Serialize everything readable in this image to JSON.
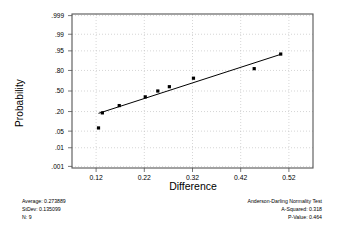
{
  "chart_data": {
    "type": "scatter",
    "title": "",
    "xlabel": "Difference",
    "ylabel": "Probability",
    "xlim": [
      0.07,
      0.57
    ],
    "xticks": [
      "0.12",
      "0.22",
      "0.32",
      "0.42",
      "0.52"
    ],
    "xtick_values": [
      0.12,
      0.22,
      0.32,
      0.42,
      0.52
    ],
    "yticks": [
      ".999",
      ".99",
      ".95",
      ".80",
      ".50",
      ".20",
      ".05",
      ".01",
      ".001"
    ],
    "ytick_values": [
      0.999,
      0.99,
      0.95,
      0.8,
      0.5,
      0.2,
      0.05,
      0.01,
      0.001
    ],
    "grid": true,
    "grid_style": "dotted",
    "points": [
      {
        "x": 0.125,
        "p": 0.065
      },
      {
        "x": 0.133,
        "p": 0.185
      },
      {
        "x": 0.168,
        "p": 0.275
      },
      {
        "x": 0.222,
        "p": 0.405
      },
      {
        "x": 0.248,
        "p": 0.5
      },
      {
        "x": 0.272,
        "p": 0.57
      },
      {
        "x": 0.322,
        "p": 0.7
      },
      {
        "x": 0.448,
        "p": 0.82
      },
      {
        "x": 0.503,
        "p": 0.935
      }
    ],
    "fit_line": {
      "x0": 0.125,
      "p0": 0.18,
      "x1": 0.505,
      "p1": 0.935
    },
    "series_name": "Difference"
  },
  "axes": {
    "y_title": "Probability",
    "x_title": "Difference"
  },
  "stats_left": {
    "average_label": "Average:",
    "average_value": "0.273889",
    "stdev_label": "StDev:",
    "stdev_value": "0.135099",
    "n_label": "N:",
    "n_value": "9",
    "line1": "Average: 0.273889",
    "line2": "StDev: 0.135099",
    "line3": "N: 9"
  },
  "stats_right": {
    "title": "Anderson-Darling Normality Test",
    "a_squared_label": "A-Squared:",
    "a_squared_value": "0.318",
    "p_value_label": "P-Value:",
    "p_value_value": "0.464",
    "line2": "A-Squared: 0.318",
    "line3": "P-Value:   0.464"
  },
  "colors": {
    "frame": "#555555",
    "grid": "#bbbbbb",
    "marker": "#000000",
    "line": "#000000",
    "text": "#1a1a1a"
  }
}
